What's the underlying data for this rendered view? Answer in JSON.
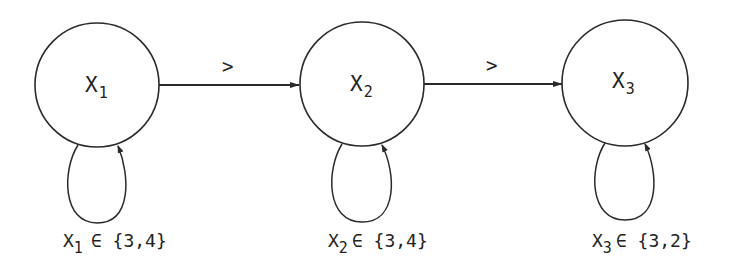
{
  "diagram": {
    "type": "constraint-graph",
    "nodes": [
      {
        "id": "x1",
        "var": "X",
        "sub": "1",
        "cx": 97,
        "cy": 85,
        "r": 62,
        "domain_label": "∈ {3,4}",
        "domain_sub": "1"
      },
      {
        "id": "x2",
        "var": "X",
        "sub": "2",
        "cx": 362,
        "cy": 84,
        "r": 62,
        "domain_label": "∈ {3,4}",
        "domain_sub": "2"
      },
      {
        "id": "x3",
        "var": "X",
        "sub": "3",
        "cx": 625,
        "cy": 83,
        "r": 63,
        "domain_label": "∈ {3,2}",
        "domain_sub": "3"
      }
    ],
    "edges": [
      {
        "from": "x1",
        "to": "x2",
        "label": ">"
      },
      {
        "from": "x2",
        "to": "x3",
        "label": ">"
      }
    ],
    "self_loops": [
      {
        "node": "x1"
      },
      {
        "node": "x2"
      },
      {
        "node": "x3"
      }
    ],
    "colors": {
      "stroke": "#2a2a2a",
      "text": "#222222",
      "background": "#ffffff"
    }
  }
}
